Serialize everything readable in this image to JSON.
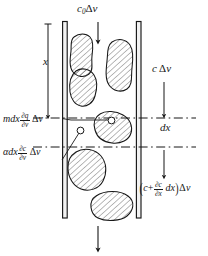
{
  "figure": {
    "ink_color": "#171717",
    "background_color": "#ffffff",
    "hatch_color": "#555555",
    "labels": {
      "inlet_flux": {
        "text": "c0 delta v",
        "c": "c",
        "sub": "0",
        "delta": "Δ",
        "v": "v"
      },
      "distance": {
        "text": "x"
      },
      "side_flux": {
        "c": "c",
        "delta": "Δ",
        "v": "v"
      },
      "slab_thickness": {
        "text": "dx"
      },
      "accumulation_solid": {
        "lead": "mdx",
        "num": "∂q",
        "den": "∂v",
        "delta": "Δ",
        "v": "v"
      },
      "accumulation_fluid": {
        "lead": "αdx",
        "num": "∂c",
        "den": "∂v",
        "delta": "Δ",
        "v": "v"
      },
      "outlet_flux": {
        "open": "(",
        "c": "c",
        "plus": "+",
        "num": "∂c",
        "den": "∂x",
        "dx": "dx",
        "close": ")",
        "delta": "Δ",
        "v": "v"
      }
    },
    "geometry": {
      "wall_left_x": 63,
      "wall_right_x": 137,
      "dash_top_y": 118,
      "dash_bottom_y": 147,
      "column_top_y": 22,
      "column_bottom_y": 218
    },
    "arrows": {
      "top_inflow": "down",
      "distance_x": "down",
      "side_inflow": "down",
      "outlet": "down",
      "bottom_outflow": "down"
    }
  }
}
